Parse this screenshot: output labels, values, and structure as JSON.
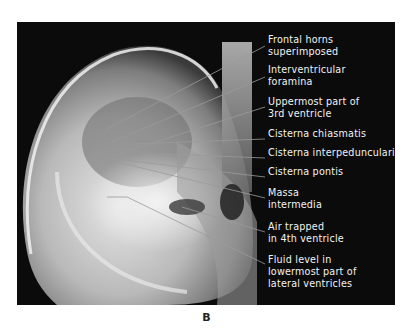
{
  "figure": {
    "panel_letter": "B",
    "labels": [
      {
        "lines": [
          "Frontal horns",
          "superimposed"
        ]
      },
      {
        "lines": [
          "Interventricular",
          "foramina"
        ]
      },
      {
        "lines": [
          "Uppermost part of",
          "3rd ventricle"
        ]
      },
      {
        "lines": [
          "Cisterna chiasmatis"
        ]
      },
      {
        "lines": [
          "Cisterna interpeduncularis"
        ]
      },
      {
        "lines": [
          "Cisterna pontis"
        ]
      },
      {
        "lines": [
          "Massa",
          "intermedia"
        ]
      },
      {
        "lines": [
          "Air trapped",
          "in 4th ventricle"
        ]
      },
      {
        "lines": [
          "Fluid level in",
          "lowermost part of",
          "lateral ventricles"
        ]
      }
    ]
  },
  "colors": {
    "background": "#0b0b0b",
    "label_text": "#f2f2f2",
    "leader_line": "#9a9a9a"
  }
}
